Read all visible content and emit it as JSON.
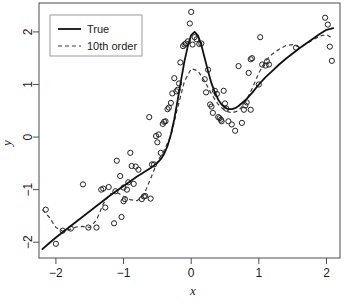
{
  "chart_data": {
    "type": "scatter",
    "title": "",
    "xlabel": "x",
    "ylabel": "y",
    "xlim": [
      -2.25,
      2.2
    ],
    "ylim": [
      -2.3,
      2.55
    ],
    "grid": false,
    "xticks": [
      -2,
      -1,
      0,
      1,
      2
    ],
    "xtick_labels": [
      "−2",
      "−1",
      "0",
      "1",
      "2"
    ],
    "yticks": [
      -2,
      -1,
      0,
      1,
      2
    ],
    "ytick_labels": [
      "−2",
      "−1",
      "0",
      "1",
      "2"
    ],
    "legend": {
      "position": "top-left",
      "entries": [
        {
          "label": "True",
          "style": "solid",
          "color": "#111111"
        },
        {
          "label": "10th order",
          "style": "dashed",
          "color": "#3d3d3d"
        }
      ]
    },
    "series": [
      {
        "name": "True",
        "type": "line",
        "style": "solid",
        "x": [
          -2.2,
          -2.1,
          -2.0,
          -1.9,
          -1.8,
          -1.7,
          -1.6,
          -1.5,
          -1.4,
          -1.3,
          -1.2,
          -1.1,
          -1.0,
          -0.9,
          -0.8,
          -0.7,
          -0.6,
          -0.5,
          -0.45,
          -0.4,
          -0.35,
          -0.3,
          -0.25,
          -0.2,
          -0.15,
          -0.1,
          -0.05,
          0.0,
          0.05,
          0.1,
          0.15,
          0.2,
          0.25,
          0.3,
          0.35,
          0.4,
          0.45,
          0.5,
          0.55,
          0.6,
          0.65,
          0.7,
          0.8,
          0.9,
          1.0,
          1.1,
          1.2,
          1.3,
          1.4,
          1.5,
          1.6,
          1.7,
          1.8,
          1.9,
          2.0,
          2.1
        ],
        "y": [
          -2.13,
          -2.02,
          -1.91,
          -1.81,
          -1.71,
          -1.61,
          -1.51,
          -1.41,
          -1.31,
          -1.21,
          -1.11,
          -1.02,
          -0.93,
          -0.84,
          -0.75,
          -0.67,
          -0.59,
          -0.49,
          -0.42,
          -0.32,
          -0.17,
          0.05,
          0.34,
          0.7,
          1.08,
          1.44,
          1.73,
          1.94,
          2.0,
          1.93,
          1.75,
          1.5,
          1.25,
          1.02,
          0.85,
          0.71,
          0.62,
          0.56,
          0.53,
          0.53,
          0.55,
          0.59,
          0.7,
          0.84,
          1.0,
          1.14,
          1.26,
          1.38,
          1.49,
          1.59,
          1.69,
          1.78,
          1.87,
          1.96,
          2.04,
          2.07
        ]
      },
      {
        "name": "10th order",
        "type": "line",
        "style": "dashed",
        "x": [
          -2.2,
          -2.1,
          -2.0,
          -1.9,
          -1.8,
          -1.7,
          -1.6,
          -1.5,
          -1.4,
          -1.3,
          -1.2,
          -1.1,
          -1.0,
          -0.9,
          -0.8,
          -0.7,
          -0.6,
          -0.5,
          -0.4,
          -0.3,
          -0.2,
          -0.1,
          0.0,
          0.1,
          0.2,
          0.3,
          0.4,
          0.5,
          0.6,
          0.7,
          0.8,
          0.9,
          1.0,
          1.1,
          1.2,
          1.3,
          1.4,
          1.5,
          1.6,
          1.7,
          1.8,
          1.9,
          2.0,
          2.1
        ],
        "y": [
          -1.38,
          -1.52,
          -1.72,
          -1.79,
          -1.76,
          -1.71,
          -1.7,
          -1.72,
          -1.58,
          -1.27,
          -1.08,
          -1.05,
          -1.13,
          -1.19,
          -1.21,
          -1.1,
          -0.79,
          -0.47,
          -0.25,
          0.02,
          0.56,
          1.06,
          1.3,
          1.26,
          1.06,
          0.82,
          0.62,
          0.5,
          0.46,
          0.5,
          0.66,
          0.92,
          1.22,
          1.45,
          1.58,
          1.67,
          1.74,
          1.76,
          1.71,
          1.77,
          1.85,
          1.92,
          1.95,
          1.87
        ],
        "note": "10th order polynomial fit, wiggly at the boundaries"
      },
      {
        "name": "observations",
        "type": "scatter",
        "marker": "open-circle",
        "points": [
          [
            -2.15,
            -1.38
          ],
          [
            -2.0,
            -2.03
          ],
          [
            -1.9,
            -1.78
          ],
          [
            -1.78,
            -1.74
          ],
          [
            -1.6,
            -0.9
          ],
          [
            -1.52,
            -1.72
          ],
          [
            -1.4,
            -1.72
          ],
          [
            -1.33,
            -1.0
          ],
          [
            -1.3,
            -0.98
          ],
          [
            -1.27,
            -1.34
          ],
          [
            -1.22,
            -0.95
          ],
          [
            -1.14,
            -1.64
          ],
          [
            -1.12,
            -1.03
          ],
          [
            -1.1,
            -0.45
          ],
          [
            -1.05,
            -0.74
          ],
          [
            -1.03,
            -1.52
          ],
          [
            -1.0,
            -1.22
          ],
          [
            -0.98,
            -1.18
          ],
          [
            -1.0,
            -0.96
          ],
          [
            -0.95,
            -1.0
          ],
          [
            -0.93,
            -0.86
          ],
          [
            -0.9,
            -0.3
          ],
          [
            -0.88,
            -0.55
          ],
          [
            -0.85,
            -0.89
          ],
          [
            -0.82,
            -0.56
          ],
          [
            -0.78,
            -0.62
          ],
          [
            -0.73,
            -1.18
          ],
          [
            -0.7,
            -1.13
          ],
          [
            -0.68,
            -1.12
          ],
          [
            -0.6,
            -1.17
          ],
          [
            -0.62,
            0.38
          ],
          [
            -0.58,
            -0.52
          ],
          [
            -0.5,
            -0.1
          ],
          [
            -0.52,
            0.02
          ],
          [
            -0.48,
            0.05
          ],
          [
            -0.45,
            -0.3
          ],
          [
            -0.4,
            0.29
          ],
          [
            -0.38,
            0.3
          ],
          [
            -0.35,
            0.53
          ],
          [
            -0.33,
            0.56
          ],
          [
            -0.3,
            0.65
          ],
          [
            -0.28,
            0.83
          ],
          [
            -0.25,
            1.12
          ],
          [
            -0.22,
            0.87
          ],
          [
            -0.2,
            0.9
          ],
          [
            -0.18,
            1.02
          ],
          [
            -0.16,
            1.42
          ],
          [
            -0.12,
            1.73
          ],
          [
            -0.1,
            1.76
          ],
          [
            -0.08,
            1.78
          ],
          [
            -0.05,
            1.82
          ],
          [
            -0.02,
            2.16
          ],
          [
            0.0,
            2.38
          ],
          [
            0.02,
            1.76
          ],
          [
            0.05,
            1.9
          ],
          [
            0.08,
            1.86
          ],
          [
            0.12,
            1.77
          ],
          [
            0.15,
            1.78
          ],
          [
            0.2,
            1.1
          ],
          [
            0.22,
            0.85
          ],
          [
            0.25,
            1.28
          ],
          [
            0.28,
            0.62
          ],
          [
            0.3,
            0.58
          ],
          [
            0.32,
            0.46
          ],
          [
            0.35,
            0.88
          ],
          [
            0.38,
            0.82
          ],
          [
            0.4,
            0.38
          ],
          [
            0.42,
            0.36
          ],
          [
            0.45,
            0.3
          ],
          [
            0.48,
            0.88
          ],
          [
            0.5,
            0.64
          ],
          [
            0.55,
            0.3
          ],
          [
            0.6,
            0.24
          ],
          [
            0.65,
            0.12
          ],
          [
            0.7,
            1.35
          ],
          [
            0.75,
            0.27
          ],
          [
            0.78,
            0.52
          ],
          [
            0.8,
            0.6
          ],
          [
            0.82,
            0.66
          ],
          [
            0.85,
            1.22
          ],
          [
            0.88,
            1.48
          ],
          [
            0.9,
            1.5
          ],
          [
            1.0,
            1.0
          ],
          [
            1.02,
            1.9
          ],
          [
            1.05,
            1.38
          ],
          [
            1.1,
            1.36
          ],
          [
            1.12,
            1.44
          ],
          [
            1.15,
            1.38
          ],
          [
            1.55,
            1.7
          ],
          [
            1.98,
            2.27
          ],
          [
            2.02,
            2.14
          ],
          [
            2.05,
            1.72
          ],
          [
            2.08,
            1.45
          ],
          [
            0.52,
            0.54
          ],
          [
            0.88,
            0.52
          ],
          [
            -0.55,
            -0.52
          ],
          [
            -0.42,
            0.25
          ],
          [
            0.44,
            0.33
          ]
        ]
      }
    ]
  },
  "axes": {
    "x_title": "x",
    "y_title": "y"
  }
}
